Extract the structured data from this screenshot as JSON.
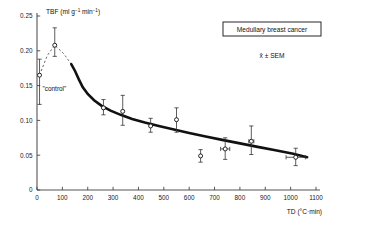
{
  "figure": {
    "annotations": {
      "title_box": "Medullary breast cancer",
      "mean_sem": "x̄ ± SEM",
      "control": "\"control\""
    }
  },
  "chart_data": {
    "type": "scatter",
    "title": "Medullary breast cancer",
    "subtitle": "x̄ ± SEM",
    "xlabel": "TD (°C·min)",
    "ylabel": "TBF (ml g⁻¹ min⁻¹)",
    "xlim": [
      0,
      1100
    ],
    "ylim": [
      0,
      0.25
    ],
    "xticks": [
      0,
      100,
      200,
      300,
      400,
      500,
      600,
      700,
      800,
      900,
      1000,
      1100
    ],
    "xticklabels": [
      "0",
      "100",
      "200",
      "300",
      "400",
      "500",
      "600",
      "700",
      "800",
      "900",
      "1000",
      "1100"
    ],
    "yticks": [
      0,
      0.05,
      0.1,
      0.15,
      0.2,
      0.25
    ],
    "yticklabels": [
      "0",
      "0.05",
      "0.10",
      "0.15",
      "0.20",
      "0.25"
    ],
    "grid": false,
    "legend": "none",
    "marker": "open-circle",
    "points": [
      {
        "x": 10,
        "y": 0.165,
        "yerr_low": 0.042,
        "yerr_high": 0.023,
        "xerr": 0,
        "label": "control"
      },
      {
        "x": 70,
        "y": 0.208,
        "yerr_low": 0.016,
        "yerr_high": 0.025,
        "xerr": 0
      },
      {
        "x": 262,
        "y": 0.118,
        "yerr_low": 0.01,
        "yerr_high": 0.012,
        "xerr": 0
      },
      {
        "x": 338,
        "y": 0.113,
        "yerr_low": 0.02,
        "yerr_high": 0.023,
        "xerr": 0
      },
      {
        "x": 448,
        "y": 0.092,
        "yerr_low": 0.009,
        "yerr_high": 0.011,
        "xerr": 0
      },
      {
        "x": 550,
        "y": 0.101,
        "yerr_low": 0.018,
        "yerr_high": 0.017,
        "xerr": 0
      },
      {
        "x": 645,
        "y": 0.049,
        "yerr_low": 0.009,
        "yerr_high": 0.009,
        "xerr": 0
      },
      {
        "x": 742,
        "y": 0.059,
        "yerr_low": 0.015,
        "yerr_high": 0.016,
        "xerr": 18
      },
      {
        "x": 845,
        "y": 0.07,
        "yerr_low": 0.019,
        "yerr_high": 0.022,
        "xerr": 10
      },
      {
        "x": 1020,
        "y": 0.047,
        "yerr_low": 0.012,
        "yerr_high": 0.013,
        "xerr": 38
      }
    ],
    "curves": [
      {
        "name": "control-to-peak-dashed",
        "style": "dashed",
        "points": [
          [
            10,
            0.165
          ],
          [
            40,
            0.193
          ],
          [
            70,
            0.208
          ],
          [
            105,
            0.196
          ],
          [
            135,
            0.181
          ]
        ]
      },
      {
        "name": "fitted-decay-solid",
        "style": "solid",
        "points": [
          [
            135,
            0.181
          ],
          [
            150,
            0.171
          ],
          [
            165,
            0.159
          ],
          [
            180,
            0.148
          ],
          [
            200,
            0.138
          ],
          [
            225,
            0.129
          ],
          [
            255,
            0.121
          ],
          [
            290,
            0.114
          ],
          [
            330,
            0.108
          ],
          [
            375,
            0.102
          ],
          [
            425,
            0.097
          ],
          [
            480,
            0.092
          ],
          [
            540,
            0.087
          ],
          [
            600,
            0.082
          ],
          [
            665,
            0.077
          ],
          [
            730,
            0.072
          ],
          [
            800,
            0.067
          ],
          [
            870,
            0.062
          ],
          [
            940,
            0.057
          ],
          [
            1010,
            0.052
          ],
          [
            1065,
            0.047
          ]
        ]
      }
    ]
  }
}
